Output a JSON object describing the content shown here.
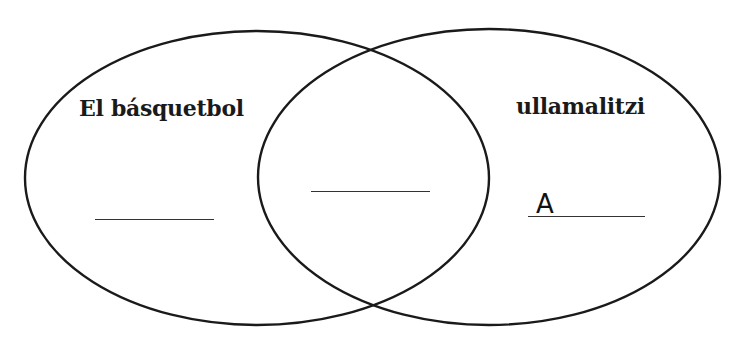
{
  "diagram": {
    "type": "venn",
    "sets": [
      {
        "id": "left",
        "label": "El básquetbol"
      },
      {
        "id": "right",
        "label": "ullamalitzi"
      }
    ],
    "blanks": {
      "left_only": {
        "answer": ""
      },
      "intersection": {
        "answer": ""
      },
      "right_only": {
        "answer": "A"
      }
    },
    "colors": {
      "stroke": "#1a1a1a",
      "background": "#ffffff"
    }
  }
}
